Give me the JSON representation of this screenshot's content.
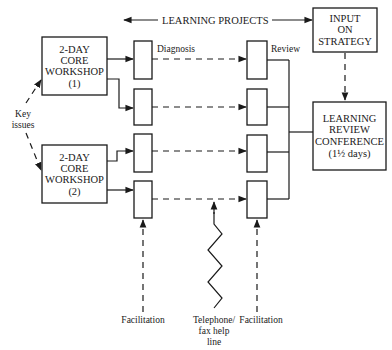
{
  "diagram": {
    "header": {
      "learning_projects": "LEARNING PROJECTS"
    },
    "workshops": [
      {
        "line1": "2-DAY",
        "line2": "CORE",
        "line3": "WORKSHOP",
        "line4": "(1)"
      },
      {
        "line1": "2-DAY",
        "line2": "CORE",
        "line3": "WORKSHOP",
        "line4": "(2)"
      }
    ],
    "key_issues": {
      "line1": "Key",
      "line2": "issues"
    },
    "column_labels": {
      "diagnosis": "Diagnosis",
      "review": "Review"
    },
    "input_strategy": {
      "line1": "INPUT",
      "line2": "ON",
      "line3": "STRATEGY"
    },
    "conference": {
      "line1": "LEARNING",
      "line2": "REVIEW",
      "line3": "CONFERENCE",
      "line4": "(1½ days)"
    },
    "bottom_labels": {
      "facilitation_left": "Facilitation",
      "telephone_line1": "Telephone/",
      "telephone_line2": "fax help",
      "telephone_line3": "line",
      "facilitation_right": "Facilitation"
    },
    "project_rows": 4
  }
}
